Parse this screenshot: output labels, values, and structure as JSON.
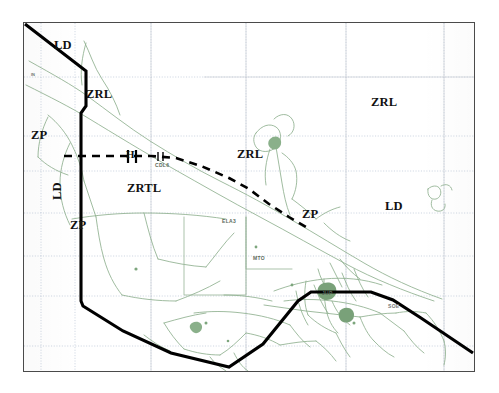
{
  "figure": {
    "type": "thematic-boundary-map",
    "background_color": "#ffffff",
    "frame_color": "#4a4a4a",
    "grid_color": "#b9c4d6",
    "hydro_color": "#8fb08f",
    "boundary_color": "#000000"
  },
  "zone_labels": [
    {
      "id": "ld-top-left",
      "text": "LD",
      "x": 54,
      "y": 38,
      "rotated": false
    },
    {
      "id": "zrl-left",
      "text": "ZRL",
      "x": 86,
      "y": 87,
      "rotated": false
    },
    {
      "id": "zp-upper-left",
      "text": "ZP",
      "x": 31,
      "y": 128,
      "rotated": false
    },
    {
      "id": "ld-left-vertical",
      "text": "LD",
      "x": 50,
      "y": 200,
      "rotated": true
    },
    {
      "id": "zp-lower-left",
      "text": "ZP",
      "x": 70,
      "y": 218,
      "rotated": false
    },
    {
      "id": "zrtl-center",
      "text": "ZRTL",
      "x": 127,
      "y": 181,
      "rotated": false
    },
    {
      "id": "zrl-center",
      "text": "ZRL",
      "x": 237,
      "y": 147,
      "rotated": false
    },
    {
      "id": "zrl-right",
      "text": "ZRL",
      "x": 371,
      "y": 95,
      "rotated": false
    },
    {
      "id": "zp-right",
      "text": "ZP",
      "x": 302,
      "y": 207,
      "rotated": false
    },
    {
      "id": "ld-right",
      "text": "LD",
      "x": 385,
      "y": 199,
      "rotated": false
    }
  ],
  "station_labels": [
    {
      "id": "in",
      "text": "IN",
      "x": 31,
      "y": 72
    },
    {
      "id": "cdl6",
      "text": "CDL6",
      "x": 155,
      "y": 162
    },
    {
      "id": "ela3",
      "text": "ELA3",
      "x": 222,
      "y": 218
    },
    {
      "id": "mto",
      "text": "MTO",
      "x": 253,
      "y": 255
    },
    {
      "id": "jup",
      "text": "JUP",
      "x": 322,
      "y": 290
    },
    {
      "id": "soe",
      "text": "SOE",
      "x": 388,
      "y": 303
    }
  ],
  "marker_labels": [
    {
      "id": "h-marker",
      "text": "H",
      "x": 126,
      "y": 148
    }
  ],
  "grid": {
    "vertical_x": [
      40,
      74,
      150,
      245,
      345,
      443
    ],
    "horizontal_y": [
      76,
      135,
      170,
      212,
      255,
      295,
      345
    ],
    "style": "dotted"
  },
  "boundaries": {
    "solid_polyline_points": "24,24 33,31 85,70 85,105 80,112 80,228 80,300 82,305 122,330 170,352 228,366 262,343 297,300 310,291 370,291 392,299 420,317 472,352",
    "dashed_polyline_points": "63,155 150,155 175,157 200,165 228,177 248,188 268,203 288,216 305,226"
  }
}
